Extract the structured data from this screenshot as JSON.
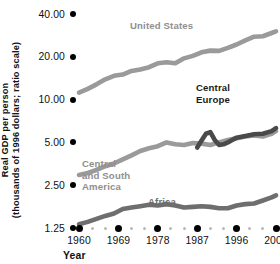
{
  "chart_data": {
    "type": "line",
    "title": "",
    "xlabel": "Year",
    "ylabel_lines": [
      "Real GDP per person",
      "(thousands of 1996 dollars; ratio scale)"
    ],
    "scale": "log",
    "grid": false,
    "legend_position": "inline-labels",
    "xlim": [
      1960,
      2005
    ],
    "ylim": [
      1.25,
      40.0
    ],
    "yticks": [
      {
        "value": 40.0,
        "label": "40.00"
      },
      {
        "value": 20.0,
        "label": "20.00"
      },
      {
        "value": 10.0,
        "label": "10.00"
      },
      {
        "value": 5.0,
        "label": "5.00"
      },
      {
        "value": 2.5,
        "label": "2.50"
      },
      {
        "value": 1.25,
        "label": "1.25"
      }
    ],
    "xticks": [
      {
        "value": 1960,
        "label": "1960"
      },
      {
        "value": 1969,
        "label": "1969"
      },
      {
        "value": 1978,
        "label": "1978"
      },
      {
        "value": 1987,
        "label": "1987"
      },
      {
        "value": 1996,
        "label": "1996"
      },
      {
        "value": 2005,
        "label": "2005"
      }
    ],
    "xminor_per_interval": 2,
    "series": [
      {
        "name": "United States",
        "label": "United States",
        "label_color": "#8f8f8f",
        "line_color": "#9a9a9a",
        "x": [
          1960,
          1962,
          1964,
          1966,
          1968,
          1970,
          1972,
          1974,
          1976,
          1978,
          1980,
          1982,
          1984,
          1986,
          1988,
          1990,
          1992,
          1994,
          1996,
          1998,
          2000,
          2002,
          2004,
          2005
        ],
        "values": [
          11.2,
          11.9,
          12.8,
          13.9,
          14.7,
          15.0,
          15.9,
          16.3,
          16.9,
          18.0,
          18.3,
          18.0,
          19.5,
          20.3,
          21.5,
          22.1,
          22.0,
          23.1,
          24.4,
          26.1,
          27.7,
          27.9,
          29.4,
          30.2
        ]
      },
      {
        "name": "Central and South America",
        "label": "Central\nand South\nAmerica",
        "label_color": "#8f8f8f",
        "line_color": "#9a9a9a",
        "x": [
          1960,
          1962,
          1964,
          1966,
          1968,
          1970,
          1972,
          1974,
          1976,
          1978,
          1980,
          1982,
          1984,
          1986,
          1988,
          1990,
          1992,
          1994,
          1996,
          1998,
          2000,
          2002,
          2004,
          2005
        ],
        "values": [
          2.95,
          3.05,
          3.2,
          3.4,
          3.55,
          3.8,
          4.05,
          4.35,
          4.55,
          4.7,
          5.0,
          4.85,
          4.8,
          4.95,
          4.9,
          4.8,
          5.0,
          5.2,
          5.35,
          5.5,
          5.6,
          5.5,
          5.75,
          6.0
        ]
      },
      {
        "name": "Central Europe",
        "label": "Central\nEurope",
        "label_color": "#1a1a1a",
        "line_color": "#4a4a4a",
        "x": [
          1987,
          1988,
          1989,
          1990,
          1991,
          1992,
          1993,
          1994,
          1995,
          1996,
          1998,
          2000,
          2002,
          2004,
          2005
        ],
        "values": [
          4.6,
          5.15,
          5.75,
          5.9,
          5.2,
          4.8,
          4.85,
          5.0,
          5.2,
          5.4,
          5.55,
          5.7,
          5.75,
          6.0,
          6.3
        ]
      },
      {
        "name": "Africa",
        "label": "Africa",
        "label_color": "#6e6e6e",
        "line_color": "#6e6e6e",
        "x": [
          1960,
          1962,
          1964,
          1966,
          1968,
          1970,
          1972,
          1974,
          1976,
          1978,
          1980,
          1982,
          1984,
          1986,
          1988,
          1990,
          1992,
          1994,
          1996,
          1998,
          2000,
          2002,
          2004,
          2005
        ],
        "values": [
          1.33,
          1.38,
          1.45,
          1.52,
          1.58,
          1.7,
          1.74,
          1.78,
          1.82,
          1.8,
          1.84,
          1.8,
          1.74,
          1.76,
          1.78,
          1.76,
          1.72,
          1.72,
          1.8,
          1.84,
          1.86,
          1.95,
          2.05,
          2.12
        ]
      }
    ]
  }
}
